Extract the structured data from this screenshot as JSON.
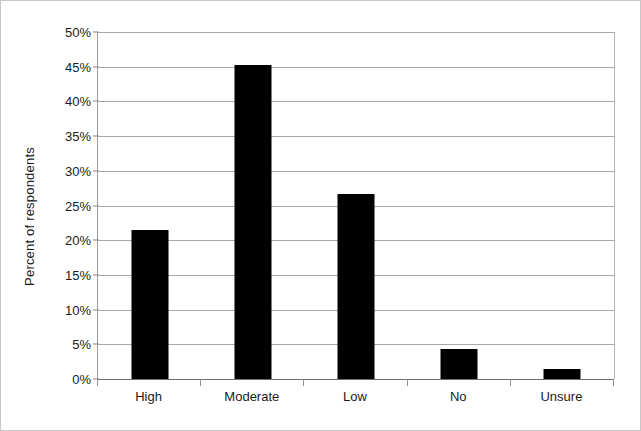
{
  "chart_data": {
    "type": "bar",
    "title": "",
    "subtitle": "",
    "xlabel": "",
    "ylabel": "Percent of respondents",
    "categories": [
      "High",
      "Moderate",
      "Low",
      "No",
      "Unsure"
    ],
    "values": [
      21.5,
      45.3,
      26.6,
      4.3,
      1.4
    ],
    "value_labels": [
      "21.5%",
      "45.3%",
      "26.6%",
      "4.3%",
      "1.4%"
    ],
    "ylim": [
      0,
      50
    ],
    "ytick_values": [
      0,
      5,
      10,
      15,
      20,
      25,
      30,
      35,
      40,
      45,
      50
    ],
    "ytick_labels": [
      "0%",
      "5%",
      "10%",
      "15%",
      "20%",
      "25%",
      "30%",
      "35%",
      "40%",
      "45%",
      "50%"
    ],
    "grid": true,
    "grid_axis": "y",
    "legend": false,
    "legend_position": "none",
    "bar_color": "#000000",
    "grid_color": "#a8a8a8",
    "axis_color": "#6e6e6e",
    "background_color": "#ffffff",
    "text_color": "#1a1a1a"
  }
}
